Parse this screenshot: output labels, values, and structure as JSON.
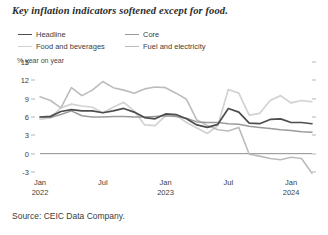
{
  "title": "Key inflation indicators softened except for food.",
  "source": "Source: CEIC Data Company.",
  "legend": {
    "items": [
      {
        "label": "Headline",
        "color": "#4d4d4d"
      },
      {
        "label": "Core",
        "color": "#9a9a9a"
      },
      {
        "label": "Food and beverages",
        "color": "#d2d2d2"
      },
      {
        "label": "Fuel and electricity",
        "color": "#bcbcbc"
      }
    ]
  },
  "chart_data": {
    "type": "line",
    "title": "Key inflation indicators softened except for food.",
    "xlabel": "",
    "ylabel": "% year on year",
    "ylim": [
      -3,
      15
    ],
    "yticks": [
      15,
      12,
      9,
      6,
      3,
      0,
      -3
    ],
    "grid": false,
    "legend_position": "top",
    "x": [
      "Jan 2022",
      "Feb 2022",
      "Mar 2022",
      "Apr 2022",
      "May 2022",
      "Jun 2022",
      "Jul 2022",
      "Aug 2022",
      "Sep 2022",
      "Oct 2022",
      "Nov 2022",
      "Dec 2022",
      "Jan 2023",
      "Feb 2023",
      "Mar 2023",
      "Apr 2023",
      "May 2023",
      "Jun 2023",
      "Jul 2023",
      "Aug 2023",
      "Sep 2023",
      "Oct 2023",
      "Nov 2023",
      "Dec 2023",
      "Jan 2024",
      "Feb 2024",
      "Mar 2024"
    ],
    "xtick_labels": [
      {
        "label": "Jan",
        "year": "2022",
        "x": "Jan 2022"
      },
      {
        "label": "Jul",
        "year": "",
        "x": "Jul 2022"
      },
      {
        "label": "Jan",
        "year": "2023",
        "x": "Jan 2023"
      },
      {
        "label": "Jul",
        "year": "",
        "x": "Jul 2023"
      },
      {
        "label": "Jan",
        "year": "2024",
        "x": "Jan 2024"
      }
    ],
    "series": [
      {
        "name": "Headline",
        "color": "#4d4d4d",
        "width": 1.7,
        "values": [
          6.0,
          6.1,
          6.9,
          7.2,
          7.0,
          7.0,
          6.7,
          7.0,
          7.4,
          6.8,
          5.9,
          5.7,
          6.5,
          6.4,
          5.7,
          4.7,
          4.3,
          4.8,
          7.4,
          6.8,
          5.0,
          4.9,
          5.6,
          5.7,
          5.1,
          5.1,
          4.9
        ]
      },
      {
        "name": "Core",
        "color": "#9a9a9a",
        "width": 1.5,
        "values": [
          6.0,
          5.9,
          6.4,
          7.0,
          6.2,
          6.0,
          6.0,
          6.1,
          6.1,
          6.0,
          6.0,
          6.1,
          6.2,
          6.1,
          5.8,
          5.2,
          5.1,
          5.1,
          4.9,
          4.8,
          4.5,
          4.3,
          4.1,
          3.9,
          3.8,
          3.6,
          3.5
        ]
      },
      {
        "name": "Food and beverages",
        "color": "#d2d2d2",
        "width": 1.7,
        "values": [
          5.6,
          5.9,
          7.5,
          8.1,
          7.8,
          7.6,
          6.7,
          7.6,
          8.4,
          7.0,
          4.7,
          4.6,
          6.2,
          6.3,
          5.1,
          4.2,
          3.3,
          4.6,
          10.5,
          9.9,
          6.3,
          6.6,
          8.7,
          9.5,
          8.3,
          8.7,
          8.5
        ]
      },
      {
        "name": "Fuel and electricity",
        "color": "#bcbcbc",
        "width": 1.6,
        "values": [
          9.3,
          8.7,
          7.5,
          10.8,
          9.5,
          10.4,
          11.8,
          10.8,
          10.4,
          9.9,
          10.6,
          10.9,
          10.8,
          9.9,
          8.9,
          5.5,
          4.6,
          3.9,
          3.7,
          4.3,
          -0.1,
          -0.4,
          -0.8,
          -1.0,
          -0.6,
          -0.8,
          -3.2
        ]
      }
    ]
  }
}
